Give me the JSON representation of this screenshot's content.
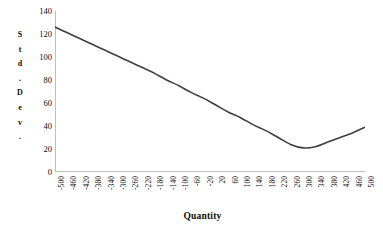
{
  "chart_data": {
    "type": "line",
    "title": "",
    "xlabel": "Quantity",
    "ylabel": "Std. Dev.",
    "ylabel_chars": [
      "S",
      "t",
      "d",
      ".",
      "D",
      "e",
      "v",
      "."
    ],
    "xlim": [
      -500,
      500
    ],
    "ylim": [
      0,
      140
    ],
    "grid": false,
    "legend": null,
    "line_color": "#3f3f3f",
    "axis_color": "#bfbfbf",
    "text_color": "#0d0d0d",
    "background": "#ffffff",
    "y_ticks": [
      0,
      20,
      40,
      60,
      80,
      100,
      120,
      140
    ],
    "x_ticks": [
      -500,
      -460,
      -420,
      -380,
      -340,
      -300,
      -260,
      -220,
      -180,
      -140,
      -100,
      -60,
      -20,
      20,
      60,
      100,
      140,
      180,
      220,
      260,
      300,
      340,
      380,
      420,
      460,
      500
    ],
    "x": [
      -500,
      -460,
      -420,
      -380,
      -340,
      -300,
      -260,
      -220,
      -180,
      -140,
      -100,
      -60,
      -20,
      20,
      60,
      100,
      140,
      180,
      220,
      260,
      300,
      340,
      380,
      420,
      460,
      500
    ],
    "values": [
      126,
      121,
      116,
      111,
      106,
      101,
      96,
      91,
      86,
      80,
      75,
      69,
      64,
      58,
      52,
      47,
      41,
      36,
      30,
      24,
      21,
      22,
      26,
      30,
      34,
      39
    ],
    "series": [
      {
        "name": "Std. Dev.",
        "values": [
          126,
          121,
          116,
          111,
          106,
          101,
          96,
          91,
          86,
          80,
          75,
          69,
          64,
          58,
          52,
          47,
          41,
          36,
          30,
          24,
          21,
          22,
          26,
          30,
          34,
          39
        ]
      }
    ],
    "minimum": {
      "x": 290,
      "y": 21
    },
    "start_point": {
      "x": -500,
      "y": 126
    },
    "end_point": {
      "x": 500,
      "y": 39
    }
  }
}
